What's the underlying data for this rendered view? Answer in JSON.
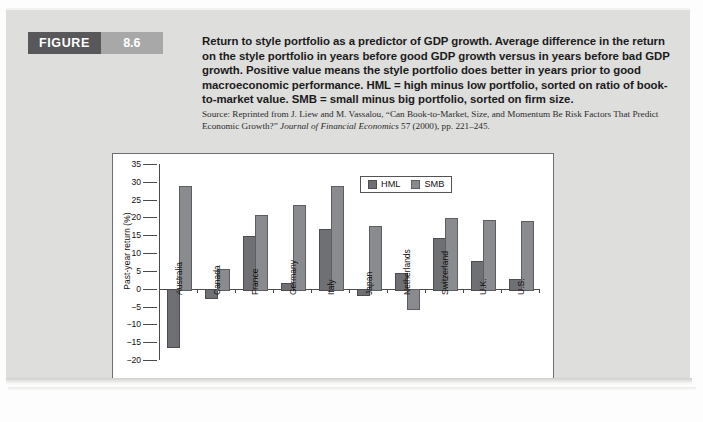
{
  "figure": {
    "badge_label": "FIGURE",
    "badge_number": "8.6",
    "caption": "Return to style portfolio as a predictor of GDP growth. Average difference in the return on the style portfolio in years before good GDP growth versus in years before bad GDP growth. Positive value means the style portfolio does better in years prior to good macroeconomic performance. HML = high minus low portfolio, sorted on ratio of book-to-market value. SMB = small minus big portfolio, sorted on firm size.",
    "source_prefix": "Source: Reprinted from J. Liew and M. Vassalou, “Can Book-to-Market, Size, and Momentum Be Risk Factors That Predict Economic Growth?” ",
    "source_italic": "Journal of Financial Economics",
    "source_suffix": " 57 (2000), pp. 221–245."
  },
  "colors": {
    "badge_dark": "#58585a",
    "badge_light": "#a8a8a8",
    "panel_background": "#dededd",
    "hml_bar": "#6f7073",
    "smb_bar": "#8a8b8e",
    "axis": "#4a4a4a"
  },
  "chart_data": {
    "type": "bar",
    "title": "",
    "xlabel": "",
    "ylabel": "Past-year return (%)",
    "ylim": [
      -20,
      35
    ],
    "ytick_step": 5,
    "yticks": [
      35,
      30,
      25,
      20,
      15,
      10,
      5,
      0,
      -5,
      -10,
      -15,
      -20
    ],
    "ytick_labels": [
      "35",
      "30",
      "25",
      "20",
      "15",
      "10",
      "5",
      "0",
      "−5",
      "−10",
      "−15",
      "−20"
    ],
    "grid": false,
    "legend_position": "top-right",
    "categories": [
      "Australia",
      "Canada",
      "France",
      "Germany",
      "Italy",
      "Japan",
      "Netherlands",
      "Switzerland",
      "U.K.",
      "U.S."
    ],
    "series": [
      {
        "name": "HML",
        "color": "#6f7073",
        "values": [
          -16.1,
          -2.2,
          14.9,
          1.5,
          16.7,
          -1.4,
          4.3,
          14.2,
          7.8,
          2.8
        ]
      },
      {
        "name": "SMB",
        "color": "#8a8b8e",
        "values": [
          28.7,
          5.6,
          20.8,
          23.5,
          28.9,
          17.7,
          -5.5,
          19.8,
          19.3,
          19.1
        ]
      }
    ]
  }
}
